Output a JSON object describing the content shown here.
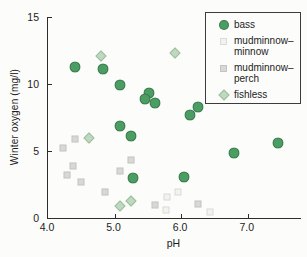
{
  "figure": {
    "background": "#fcfcfa",
    "axis_color": "#2d2d2d",
    "text_color": "#1d1d1d"
  },
  "chart_data": {
    "type": "scatter",
    "title": "",
    "xlabel": "pH",
    "ylabel": "Winter oxygen (mg/l)",
    "xlim": [
      4.0,
      7.8
    ],
    "ylim": [
      0,
      15
    ],
    "x_ticks": [
      "4.0",
      "5.0",
      "6.0",
      "7.0"
    ],
    "x_tick_values": [
      4.0,
      5.0,
      6.0,
      7.0
    ],
    "y_ticks": [
      "0",
      "5",
      "10",
      "15"
    ],
    "y_tick_values": [
      0,
      5,
      10,
      15
    ],
    "grid": false,
    "legend_position": "top-right",
    "series": [
      {
        "name": "bass",
        "marker": "circle",
        "color": "#4b9d63",
        "points": [
          [
            4.4,
            11.3
          ],
          [
            4.83,
            11.1
          ],
          [
            5.08,
            9.9
          ],
          [
            5.52,
            9.35
          ],
          [
            5.45,
            8.85
          ],
          [
            5.6,
            8.55
          ],
          [
            6.25,
            8.25
          ],
          [
            6.13,
            7.7
          ],
          [
            5.08,
            6.9
          ],
          [
            5.25,
            6.1
          ],
          [
            7.45,
            5.6
          ],
          [
            6.8,
            4.85
          ],
          [
            6.05,
            3.05
          ],
          [
            5.28,
            2.95
          ]
        ]
      },
      {
        "name": "mudminnow–minnow",
        "marker": "square",
        "color": "#f2f2ee",
        "points": [
          [
            5.78,
            1.55
          ],
          [
            5.95,
            1.95
          ],
          [
            5.77,
            0.6
          ],
          [
            6.43,
            0.45
          ]
        ]
      },
      {
        "name": "mudminnow–perch",
        "marker": "square",
        "color": "#d8d8d4",
        "points": [
          [
            4.4,
            5.9
          ],
          [
            4.23,
            5.2
          ],
          [
            4.38,
            3.85
          ],
          [
            4.28,
            3.2
          ],
          [
            4.5,
            2.7
          ],
          [
            4.85,
            1.95
          ],
          [
            5.08,
            3.5
          ],
          [
            5.25,
            4.35
          ],
          [
            5.6,
            1.0
          ],
          [
            6.25,
            1.05
          ]
        ]
      },
      {
        "name": "fishless",
        "marker": "diamond",
        "color": "#bfd9c0",
        "points": [
          [
            4.8,
            12.1
          ],
          [
            5.9,
            12.35
          ],
          [
            4.62,
            5.95
          ],
          [
            5.08,
            0.9
          ],
          [
            5.25,
            1.3
          ]
        ]
      }
    ]
  },
  "legend": {
    "items": [
      {
        "marker": "circle",
        "color": "#4b9d63",
        "line1": "bass",
        "line2": ""
      },
      {
        "marker": "square",
        "color": "#f2f2ee",
        "line1": "mudminnow–",
        "line2": "minnow"
      },
      {
        "marker": "square",
        "color": "#d8d8d4",
        "line1": "mudminnow–",
        "line2": "perch"
      },
      {
        "marker": "diamond",
        "color": "#bfd9c0",
        "line1": "fishless",
        "line2": ""
      }
    ]
  }
}
